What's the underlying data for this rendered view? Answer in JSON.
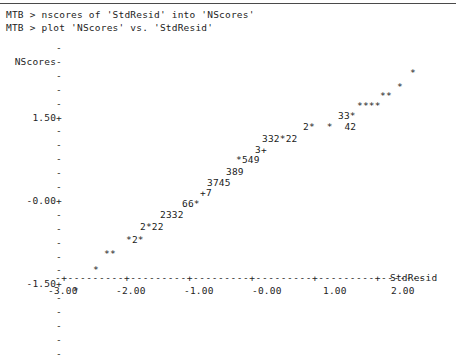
{
  "terminal": {
    "lines": [
      "MTB > nscores of 'StdResid' into 'NScores'",
      "MTB > plot 'NScores' vs. 'StdResid'"
    ]
  },
  "chart_data": {
    "type": "scatter",
    "title": "",
    "xlabel": "StdResid",
    "ylabel": "NScores",
    "xlim": [
      -3.0,
      2.5
    ],
    "ylim": [
      -2.6,
      2.6
    ],
    "grid": false,
    "legend": null,
    "xticklabels": [
      "-3.00",
      "-2.00",
      "-1.00",
      "-0.00",
      "1.00",
      "2.00"
    ],
    "xtickvalues": [
      -3.0,
      -2.0,
      -1.0,
      0.0,
      1.0,
      2.0
    ],
    "yticklabels": [
      "1.50+",
      "-0.00+",
      "-1.50+"
    ],
    "ytickvalues": [
      1.5,
      0.0,
      -1.5
    ],
    "axis_char_x": "-+---------+---------+---------+---------+---------+-------",
    "rows": [
      {
        "y": 2.3,
        "text": "*",
        "left": 410
      },
      {
        "y": 2.05,
        "text": "*",
        "left": 397
      },
      {
        "y": 1.88,
        "text": "**",
        "left": 380
      },
      {
        "y": 1.7,
        "text": "****",
        "left": 357
      },
      {
        "y": 1.52,
        "text": "33*",
        "left": 338
      },
      {
        "y": 1.33,
        "text": "2*  *  42",
        "left": 303
      },
      {
        "y": 1.12,
        "text": "332*22",
        "left": 262
      },
      {
        "y": 0.92,
        "text": "3+",
        "left": 255
      },
      {
        "y": 0.73,
        "text": "*549",
        "left": 236
      },
      {
        "y": 0.52,
        "text": "389",
        "left": 226
      },
      {
        "y": 0.33,
        "text": "3745",
        "left": 207
      },
      {
        "y": 0.14,
        "text": "+7",
        "left": 200
      },
      {
        "y": -0.06,
        "text": "66*",
        "left": 182
      },
      {
        "y": -0.26,
        "text": "2332",
        "left": 160
      },
      {
        "y": -0.47,
        "text": "2*22",
        "left": 140
      },
      {
        "y": -0.7,
        "text": "*2*",
        "left": 126
      },
      {
        "y": -0.96,
        "text": "**",
        "left": 104
      },
      {
        "y": -1.24,
        "text": "*",
        "left": 93
      },
      {
        "y": -1.62,
        "text": "*",
        "left": 73
      }
    ]
  },
  "yaxis": {
    "rows": [
      {
        "label": "",
        "tick": "-"
      },
      {
        "label": "NScores",
        "tick": "-"
      },
      {
        "label": "",
        "tick": "-"
      },
      {
        "label": "",
        "tick": "-"
      },
      {
        "label": "",
        "tick": "-"
      },
      {
        "label": "1.50",
        "tick": "+"
      },
      {
        "label": "",
        "tick": "-"
      },
      {
        "label": "",
        "tick": "-"
      },
      {
        "label": "",
        "tick": "-"
      },
      {
        "label": "",
        "tick": "-"
      },
      {
        "label": "",
        "tick": "-"
      },
      {
        "label": "-0.00",
        "tick": "+"
      },
      {
        "label": "",
        "tick": "-"
      },
      {
        "label": "",
        "tick": "-"
      },
      {
        "label": "",
        "tick": "-"
      },
      {
        "label": "",
        "tick": "-"
      },
      {
        "label": "",
        "tick": "-"
      },
      {
        "label": "-1.50",
        "tick": "+"
      },
      {
        "label": "",
        "tick": "-"
      },
      {
        "label": "",
        "tick": "-"
      },
      {
        "label": "",
        "tick": "-"
      },
      {
        "label": "",
        "tick": "-"
      },
      {
        "label": "",
        "tick": "-"
      }
    ]
  },
  "xaxis": {
    "line": "-+---------+---------+---------+---------+---------+-------",
    "title": "StdResid",
    "ticks": [
      {
        "label": "-3.00",
        "left": 48
      },
      {
        "label": "-2.00",
        "left": 116
      },
      {
        "label": "-1.00",
        "left": 184
      },
      {
        "label": "-0.00",
        "left": 252
      },
      {
        "label": "1.00",
        "left": 323
      },
      {
        "label": "2.00",
        "left": 391
      }
    ]
  }
}
